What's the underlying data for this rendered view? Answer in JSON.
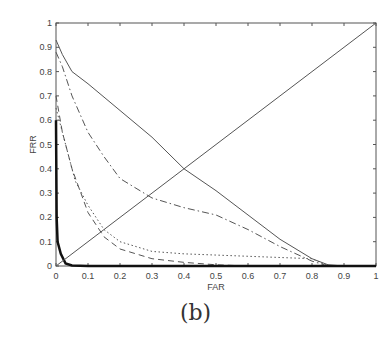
{
  "chart_data": {
    "type": "line",
    "title": "",
    "xlabel": "FAR",
    "ylabel": "FRR",
    "xlim": [
      0,
      1
    ],
    "ylim": [
      0,
      1
    ],
    "xticks": [
      "0",
      "0.1",
      "0.2",
      "0.3",
      "0.4",
      "0.5",
      "0.6",
      "0.7",
      "0.8",
      "0.9",
      "1"
    ],
    "yticks": [
      "0",
      "0.1",
      "0.2",
      "0.3",
      "0.4",
      "0.5",
      "0.6",
      "0.7",
      "0.8",
      "0.9",
      "1"
    ],
    "grid": false,
    "series": [
      {
        "name": "solid",
        "style": "solid",
        "width": 1,
        "x": [
          0,
          0.02,
          0.05,
          0.1,
          0.2,
          0.3,
          0.4,
          0.5,
          0.6,
          0.7,
          0.8,
          0.85,
          0.9,
          1
        ],
        "y": [
          0.93,
          0.87,
          0.8,
          0.75,
          0.64,
          0.53,
          0.4,
          0.31,
          0.21,
          0.11,
          0.03,
          0.005,
          0,
          0
        ]
      },
      {
        "name": "dash-dot",
        "style": "dashdot",
        "width": 1,
        "x": [
          0,
          0.02,
          0.05,
          0.1,
          0.15,
          0.2,
          0.3,
          0.4,
          0.5,
          0.6,
          0.7,
          0.8,
          0.85,
          1
        ],
        "y": [
          0.88,
          0.82,
          0.7,
          0.55,
          0.45,
          0.36,
          0.28,
          0.24,
          0.21,
          0.15,
          0.08,
          0.02,
          0,
          0
        ]
      },
      {
        "name": "dotted",
        "style": "dotted",
        "width": 1,
        "x": [
          0,
          0.03,
          0.06,
          0.1,
          0.15,
          0.2,
          0.3,
          0.4,
          0.6,
          0.8,
          0.85,
          1
        ],
        "y": [
          0.65,
          0.5,
          0.35,
          0.25,
          0.15,
          0.1,
          0.06,
          0.05,
          0.04,
          0.03,
          0,
          0
        ]
      },
      {
        "name": "dashed",
        "style": "dashed",
        "width": 1,
        "x": [
          0,
          0.02,
          0.05,
          0.1,
          0.15,
          0.2,
          0.3,
          0.4,
          0.5,
          0.6,
          1
        ],
        "y": [
          0.7,
          0.55,
          0.4,
          0.22,
          0.12,
          0.07,
          0.03,
          0.015,
          0.005,
          0,
          0
        ]
      },
      {
        "name": "thick",
        "style": "solid",
        "width": 2.5,
        "x": [
          0,
          0.002,
          0.005,
          0.015,
          0.03,
          0.05,
          0.1,
          1
        ],
        "y": [
          0.6,
          0.2,
          0.1,
          0.05,
          0.01,
          0.002,
          0,
          0
        ]
      },
      {
        "name": "EER line",
        "style": "solid",
        "width": 1,
        "x": [
          0,
          1
        ],
        "y": [
          0,
          1
        ]
      }
    ]
  },
  "caption": "(b)"
}
